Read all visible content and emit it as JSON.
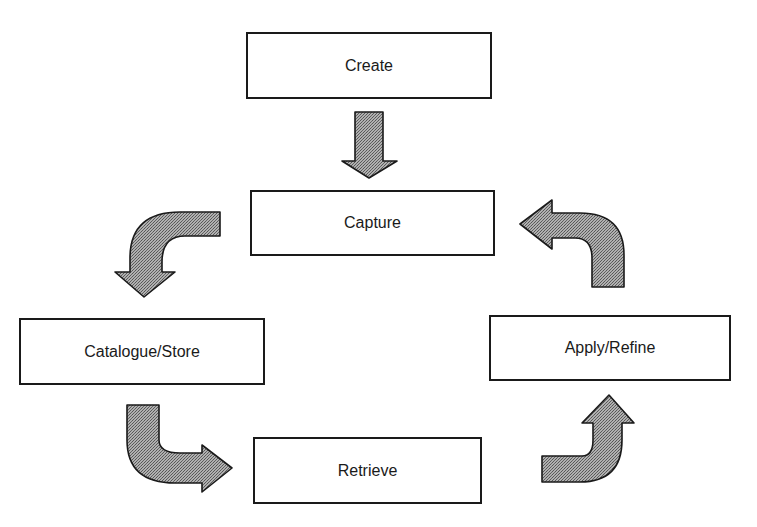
{
  "diagram": {
    "type": "cycle-flow",
    "nodes": [
      {
        "id": "create",
        "label": "Create"
      },
      {
        "id": "capture",
        "label": "Capture"
      },
      {
        "id": "catalogue_store",
        "label": "Catalogue/Store"
      },
      {
        "id": "retrieve",
        "label": "Retrieve"
      },
      {
        "id": "apply_refine",
        "label": "Apply/Refine"
      }
    ],
    "edges": [
      {
        "from": "create",
        "to": "capture",
        "style": "straight-down-arrow"
      },
      {
        "from": "capture",
        "to": "catalogue_store",
        "style": "curved-arrow"
      },
      {
        "from": "catalogue_store",
        "to": "retrieve",
        "style": "curved-arrow"
      },
      {
        "from": "retrieve",
        "to": "apply_refine",
        "style": "curved-arrow"
      },
      {
        "from": "apply_refine",
        "to": "capture",
        "style": "curved-arrow"
      }
    ],
    "colors": {
      "border": "#1a1a1a",
      "arrow_fill": "#999999",
      "background": "#ffffff"
    }
  }
}
